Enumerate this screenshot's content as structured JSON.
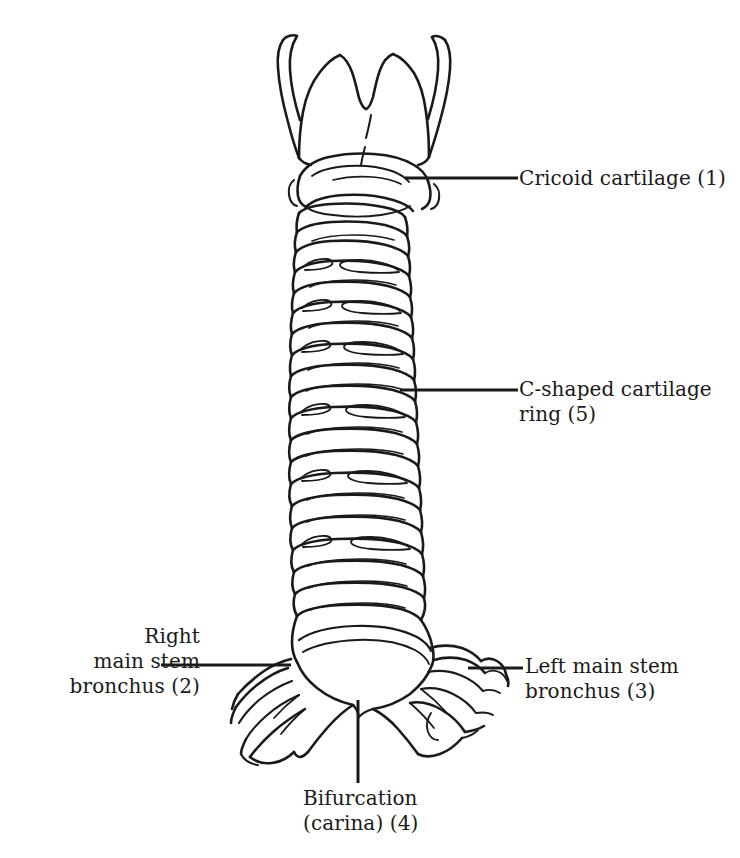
{
  "figure": {
    "background_color": "#ffffff",
    "line_color": "#1a1a1a",
    "text_color": "#1a1a1a",
    "width": 740,
    "height": 858
  },
  "labels": {
    "cricoid": {
      "line1": "Cricoid cartilage (1)",
      "number": "1",
      "name": "Cricoid cartilage"
    },
    "cshaped": {
      "line1": "C-shaped cartilage",
      "line2": "ring (5)",
      "number": "5",
      "name": "C-shaped cartilage ring"
    },
    "right_bronchus": {
      "line1": "Right",
      "line2": "main stem",
      "line3": "bronchus (2)",
      "number": "2",
      "name": "Right main stem bronchus"
    },
    "left_bronchus": {
      "line1": "Left main stem",
      "line2": "bronchus (3)",
      "number": "3",
      "name": "Left main stem bronchus"
    },
    "bifurcation": {
      "line1": "Bifurcation",
      "line2": "(carina) (4)",
      "number": "4",
      "name": "Bifurcation (carina)"
    }
  },
  "structures": {
    "thyroid_cartilage": "thyroid-cartilage",
    "cricoid_cartilage": "cricoid-cartilage",
    "trachea": "trachea",
    "tracheal_rings": "tracheal-cartilage-rings",
    "carina": "carina",
    "right_main_bronchus": "right-main-stem-bronchus",
    "left_main_bronchus": "left-main-stem-bronchus"
  }
}
